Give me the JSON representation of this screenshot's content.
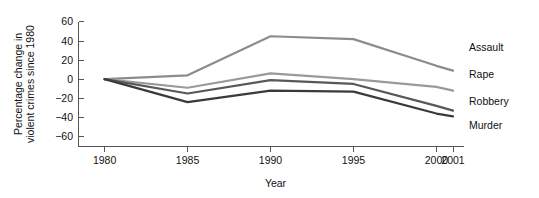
{
  "chart_data": {
    "type": "line",
    "title": "",
    "xlabel": "Year",
    "ylabel_lines": [
      "Percentage change in",
      "violent crimes since 1980"
    ],
    "ylabel": "Percentage change in violent crimes since 1980",
    "x": [
      1980,
      1985,
      1990,
      1995,
      2000,
      2001
    ],
    "xticklabels": [
      "1980",
      "1985",
      "1990",
      "1995",
      "2000",
      "2001"
    ],
    "yticks": [
      60,
      40,
      20,
      0,
      -20,
      -40,
      -60
    ],
    "yticklabels": [
      "60",
      "40",
      "20",
      "0",
      "−20",
      "−40",
      "−60"
    ],
    "ylim": [
      -70,
      62
    ],
    "xlim": [
      1979,
      2001.6
    ],
    "grid": false,
    "legend_position": "right-inline-labels",
    "series": [
      {
        "name": "Assault",
        "color": "#8c8c8c",
        "values": [
          0,
          4,
          45,
          42,
          14,
          9
        ],
        "label_x": 2001.6,
        "label_y": 33
      },
      {
        "name": "Rape",
        "color": "#9a9a9a",
        "values": [
          0,
          -9,
          6,
          0,
          -8,
          -12
        ],
        "label_x": 2001.6,
        "label_y": 5
      },
      {
        "name": "Robbery",
        "color": "#585858",
        "values": [
          0,
          -15,
          -1,
          -5,
          -28,
          -33
        ],
        "label_x": 2001.6,
        "label_y": -23
      },
      {
        "name": "Murder",
        "color": "#3a3a3a",
        "values": [
          0,
          -24,
          -12,
          -13,
          -36,
          -39
        ],
        "label_x": 2001.6,
        "label_y": -48
      }
    ]
  },
  "axis": {
    "axis_color": "#555555",
    "tick_color": "#555555"
  }
}
